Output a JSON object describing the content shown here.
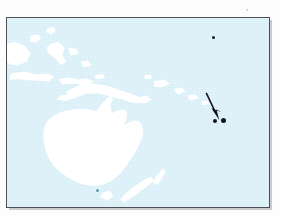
{
  "figure": {
    "kind": "reference-locator-map",
    "region": "Oceania / South-West Pacific",
    "caption": "",
    "projection_hint": "equirectangular"
  },
  "colors": {
    "ocean": "#d6edf6",
    "land": "#ffffff",
    "frame": "#4a4f55",
    "frame_shadow": "#c9ccce",
    "page": "#fdfdfd",
    "marker": "#12161a",
    "marker_faint": "#4f8ea4",
    "annotation": "#111418"
  },
  "frame": {
    "x": 6,
    "y": 17,
    "width": 264,
    "height": 191,
    "border_width": 1.5
  },
  "annotation": {
    "type": "arrow",
    "label": "",
    "tail": {
      "x": 207,
      "y": 94
    },
    "head": {
      "x": 219,
      "y": 116
    },
    "points_to": "highlighted-island-pair"
  },
  "markers": [
    {
      "name": "highlighted-island-west",
      "x": 214,
      "y": 121,
      "r": 2.1,
      "style": "solid"
    },
    {
      "name": "highlighted-island-east",
      "x": 222.5,
      "y": 121,
      "r": 2.4,
      "style": "solid"
    },
    {
      "name": "north-east-island-speck",
      "x": 212,
      "y": 37,
      "r": 1.6,
      "style": "solid"
    },
    {
      "name": "southern-island-speck",
      "x": 97,
      "y": 190,
      "r": 1.7,
      "style": "faint"
    }
  ],
  "landmasses": [
    {
      "name": "australia-mainland"
    },
    {
      "name": "tasmania"
    },
    {
      "name": "new-guinea"
    },
    {
      "name": "borneo"
    },
    {
      "name": "sulawesi"
    },
    {
      "name": "java-lesser-sunda-chain"
    },
    {
      "name": "philippines-fragments"
    },
    {
      "name": "new-britain"
    },
    {
      "name": "solomon-islands-chain"
    },
    {
      "name": "new-zealand-north-island"
    },
    {
      "name": "new-zealand-south-island"
    }
  ],
  "artifacts": [
    {
      "name": "scan-speck-top-right",
      "x": 246,
      "y": 9
    }
  ]
}
